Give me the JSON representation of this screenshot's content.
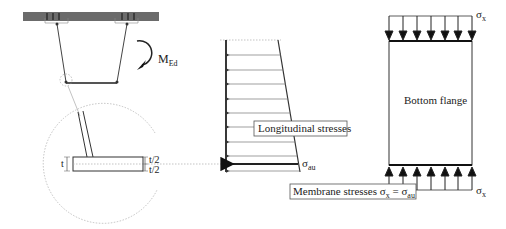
{
  "diagram": {
    "cross_section": {
      "moment_label": "M",
      "moment_subscript": "Ed"
    },
    "detail": {
      "thickness_label": "t",
      "half_thickness_top": "t/2",
      "half_thickness_bottom": "t/2"
    },
    "stress_diagram": {
      "box_label": "Longitudinal stresses",
      "sigma_symbol": "σ",
      "sigma_subscript": "au"
    },
    "flange": {
      "label": "Bottom flange",
      "top_sigma": "σ",
      "top_sigma_sub": "x",
      "bottom_sigma": "σ",
      "bottom_sigma_sub": "x"
    },
    "membrane": {
      "prefix": "Membrane stresses ",
      "sigma1": "σ",
      "sigma1_sub": "x",
      "equals": " = ",
      "sigma2": "σ",
      "sigma2_sub": "au"
    },
    "colors": {
      "deck": "#6b6b6b",
      "line": "#333333",
      "dotted": "#9a9a9a"
    }
  }
}
